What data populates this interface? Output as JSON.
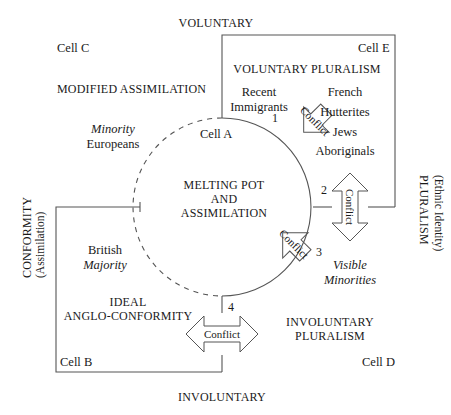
{
  "diagram": {
    "title_axes": {
      "top": "VOLUNTARY",
      "bottom": "INVOLUNTARY",
      "left_line1": "CONFORMITY",
      "left_line2": "(Assimilation)",
      "right_line1": "PLURALISM",
      "right_line2": "(Ethnic Identity)"
    },
    "center": {
      "line1": "MELTING POT",
      "line2": "AND",
      "line3": "ASSIMILATION",
      "cell_a": "Cell A"
    },
    "cells": {
      "cell_b": "Cell B",
      "cell_c": "Cell C",
      "cell_d": "Cell D",
      "cell_e": "Cell E"
    },
    "quadrants": {
      "top_left_title": "MODIFIED ASSIMILATION",
      "top_right_title": "VOLUNTARY PLURALISM",
      "bottom_left_title_line1": "IDEAL",
      "bottom_left_title_line2": "ANGLO-CONFORMITY",
      "bottom_right_title_line1": "INVOLUNTARY",
      "bottom_right_title_line2": "PLURALISM"
    },
    "groups": {
      "recent_immigrants_line1": "Recent",
      "recent_immigrants_line2": "Immigrants",
      "minority_europeans_line1": "Minority",
      "minority_europeans_line2": "Europeans",
      "british_majority_line1": "British",
      "british_majority_line2": "Majority",
      "visible_minorities_line1": "Visible",
      "visible_minorities_line2": "Minorities",
      "pluralism_list": [
        "French",
        "Hutterites",
        "Jews",
        "Aboriginals"
      ]
    },
    "conflicts": [
      {
        "number": "1",
        "label": "Conflict"
      },
      {
        "number": "2",
        "label": "Conflict"
      },
      {
        "number": "3",
        "label": "Conflict"
      },
      {
        "number": "4",
        "label": "Conflict"
      }
    ],
    "colors": {
      "stroke": "#555555",
      "text": "#1a1a1a",
      "background": "#ffffff"
    }
  }
}
